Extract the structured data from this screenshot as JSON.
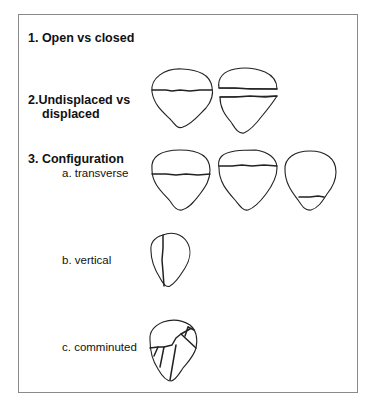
{
  "diagram": {
    "sections": [
      {
        "id": "open_closed",
        "label": "1. Open vs  closed"
      },
      {
        "id": "displacement",
        "label_line1": "2.Undisplaced vs",
        "label_line2": "displaced",
        "figures": [
          "undisplaced-transverse",
          "displaced-transverse"
        ]
      },
      {
        "id": "configuration",
        "label": "3. Configuration",
        "subtypes": [
          {
            "label": "a. transverse",
            "figures": [
              "transverse-mid",
              "transverse-upper",
              "transverse-lower-pole"
            ]
          },
          {
            "label": "b. vertical",
            "figures": [
              "vertical"
            ]
          },
          {
            "label": "c. comminuted",
            "figures": [
              "comminuted"
            ]
          }
        ]
      }
    ]
  },
  "colors": {
    "line": "#222222",
    "frame": "#8a8a8a",
    "background": "#ffffff"
  }
}
